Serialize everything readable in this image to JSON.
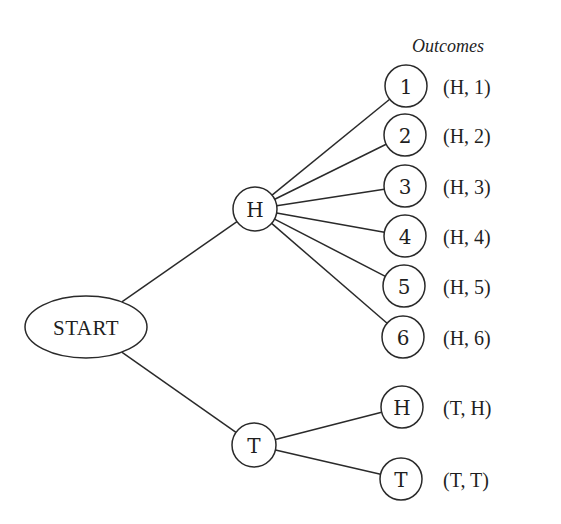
{
  "diagram": {
    "type": "tree-diagram",
    "header": "Outcomes",
    "root": {
      "id": "start",
      "label": "START"
    },
    "level1": [
      {
        "id": "h",
        "label": "H"
      },
      {
        "id": "t",
        "label": "T"
      }
    ],
    "leaves": [
      {
        "id": "h1",
        "parent": "h",
        "label": "1",
        "outcome": "(H, 1)"
      },
      {
        "id": "h2",
        "parent": "h",
        "label": "2",
        "outcome": "(H, 2)"
      },
      {
        "id": "h3",
        "parent": "h",
        "label": "3",
        "outcome": "(H, 3)"
      },
      {
        "id": "h4",
        "parent": "h",
        "label": "4",
        "outcome": "(H, 4)"
      },
      {
        "id": "h5",
        "parent": "h",
        "label": "5",
        "outcome": "(H, 5)"
      },
      {
        "id": "h6",
        "parent": "h",
        "label": "6",
        "outcome": "(H, 6)"
      },
      {
        "id": "th",
        "parent": "t",
        "label": "H",
        "outcome": "(T, H)"
      },
      {
        "id": "tt",
        "parent": "t",
        "label": "T",
        "outcome": "(T, T)"
      }
    ],
    "colors": {
      "stroke": "#2a2a2a",
      "text": "#1f1f1f",
      "background": "#ffffff"
    }
  }
}
